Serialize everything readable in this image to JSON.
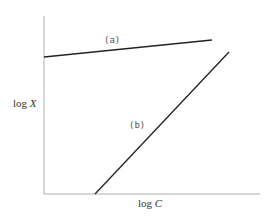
{
  "chart_data": {
    "type": "line",
    "title": "",
    "xlabel": "log C",
    "ylabel": "log X",
    "xlabel_parts": {
      "prefix": "log ",
      "var": "C"
    },
    "ylabel_parts": {
      "prefix": "log ",
      "var": "X"
    },
    "grid": false,
    "legend": "none",
    "tick_labels": false,
    "series": [
      {
        "name": "(a)",
        "label": "(a)",
        "points_px": [
          [
            44,
            57
          ],
          [
            212,
            40
          ]
        ],
        "description": "shallow slope, nearly flat"
      },
      {
        "name": "(b)",
        "label": "(b)",
        "points_px": [
          [
            95,
            194
          ],
          [
            229,
            52
          ]
        ],
        "description": "steep slope"
      }
    ]
  },
  "colors": {
    "axis": "#aaaaaa",
    "line": "#222222",
    "text": "#333333"
  }
}
